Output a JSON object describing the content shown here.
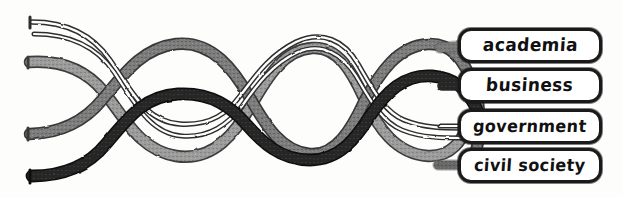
{
  "figure": {
    "background_color": "#fdfdfc",
    "style": "hand-drawn ink sketch"
  },
  "labels": [
    {
      "id": "academia",
      "text": "academia",
      "strand_style": "light-gray-ribbon",
      "strand_color": "#8d8d8d"
    },
    {
      "id": "business",
      "text": "business",
      "strand_style": "dark-solid-ribbon",
      "strand_color": "#2a2a2a"
    },
    {
      "id": "government",
      "text": "government",
      "strand_style": "thin-outline-ribbon",
      "strand_color": "#3a3a3a"
    },
    {
      "id": "civil-society",
      "text": "civil society",
      "strand_style": "medium-gray-ribbon",
      "strand_color": "#767676"
    }
  ],
  "strands": [
    {
      "id": "strand-outline",
      "name": "thin outline strand",
      "fill": "#ffffff",
      "stroke": "#3a3a3a",
      "start_y": 22,
      "end_label": "government"
    },
    {
      "id": "strand-light",
      "name": "light gray strand",
      "fill": "#9a9a9a",
      "stroke": "#4a4a4a",
      "start_y": 62,
      "end_label": "academia"
    },
    {
      "id": "strand-medium",
      "name": "medium gray strand",
      "fill": "#7a7a7a",
      "stroke": "#3d3d3d",
      "start_y": 132,
      "end_label": "civil-society"
    },
    {
      "id": "strand-dark",
      "name": "dark black strand",
      "fill": "#272727",
      "stroke": "#0f0f0f",
      "start_y": 174,
      "end_label": "business"
    }
  ],
  "colors": {
    "ink": "#1a1a1a",
    "paper": "#fdfdfc",
    "light_gray": "#9a9a9a",
    "medium_gray": "#7a7a7a",
    "dark": "#272727"
  }
}
